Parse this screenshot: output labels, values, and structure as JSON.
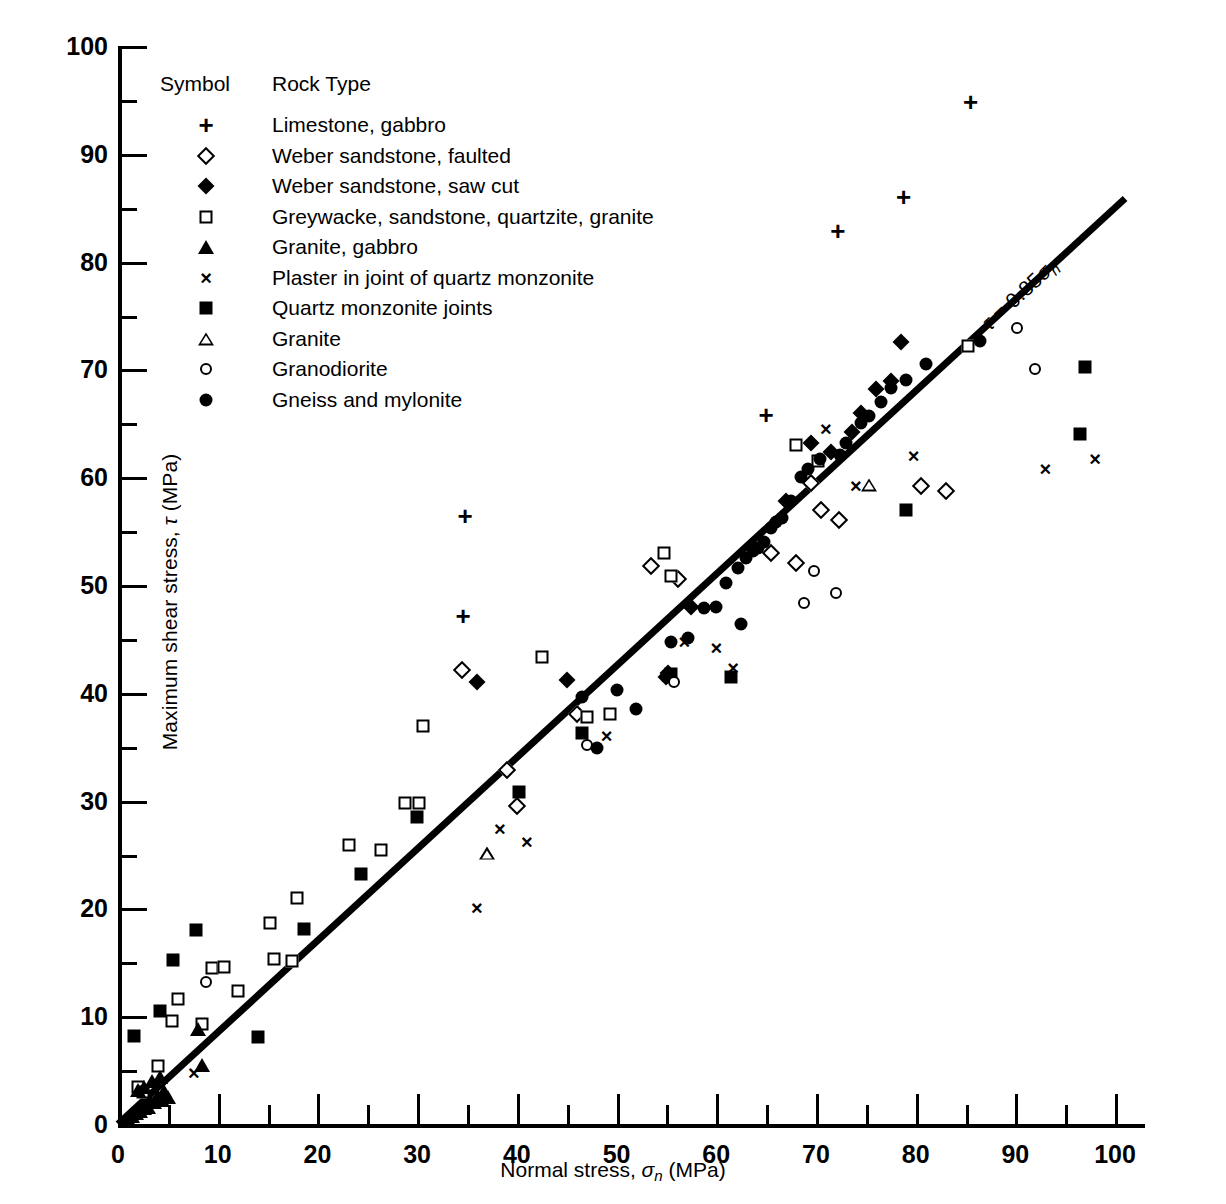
{
  "chart_data": {
    "type": "scatter",
    "title": "",
    "xlabel": "Normal stress, σn (MPa)",
    "ylabel": "Maximum shear stress, τ (MPa)",
    "xlim": [
      0,
      103
    ],
    "ylim": [
      0,
      100
    ],
    "x_major_ticks": [
      0,
      10,
      20,
      30,
      40,
      50,
      60,
      70,
      80,
      90,
      100
    ],
    "x_minor_ticks": [
      5,
      15,
      25,
      35,
      45,
      55,
      65,
      75,
      85,
      95
    ],
    "y_major_ticks": [
      0,
      10,
      20,
      30,
      40,
      50,
      60,
      70,
      80,
      90,
      100
    ],
    "y_minor_ticks": [
      5,
      15,
      25,
      35,
      45,
      55,
      65,
      75,
      85,
      95
    ],
    "grid": false,
    "legend_position": "upper-left-inside",
    "trendline": {
      "label": "τ = 0.85σn",
      "slope": 0.85,
      "intercept": 0,
      "x_start": 0,
      "x_end": 101
    },
    "legend_header": {
      "symbol": "Symbol",
      "rock_type": "Rock Type"
    },
    "series": [
      {
        "name": "Limestone, gabbro",
        "marker": "plus",
        "points": [
          [
            34.8,
            56.4
          ],
          [
            34.6,
            47.1
          ],
          [
            65.0,
            65.8
          ],
          [
            72.2,
            82.8
          ],
          [
            78.8,
            86.0
          ],
          [
            85.5,
            94.8
          ]
        ]
      },
      {
        "name": "Weber sandstone, faulted",
        "marker": "open-diamond",
        "points": [
          [
            34.5,
            42.1
          ],
          [
            40.0,
            29.5
          ],
          [
            39.0,
            32.8
          ],
          [
            46.0,
            38.0
          ],
          [
            53.5,
            51.8
          ],
          [
            56.2,
            50.6
          ],
          [
            68.0,
            52.0
          ],
          [
            69.5,
            59.5
          ],
          [
            70.5,
            57.0
          ],
          [
            80.5,
            59.2
          ],
          [
            83.0,
            58.7
          ],
          [
            72.3,
            56.0
          ],
          [
            65.5,
            53.0
          ]
        ]
      },
      {
        "name": "Weber sandstone, saw cut",
        "marker": "filled-diamond",
        "points": [
          [
            36.0,
            41.0
          ],
          [
            45.0,
            41.2
          ],
          [
            55.0,
            41.5
          ],
          [
            57.5,
            48.0
          ],
          [
            67.0,
            57.8
          ],
          [
            69.5,
            63.2
          ],
          [
            71.5,
            62.3
          ],
          [
            73.6,
            64.2
          ],
          [
            74.5,
            66.0
          ],
          [
            76.0,
            68.2
          ],
          [
            77.5,
            68.9
          ],
          [
            78.5,
            72.5
          ],
          [
            55.2,
            41.8
          ]
        ]
      },
      {
        "name": "Greywacke, sandstone, quartzite, granite",
        "marker": "open-square",
        "points": [
          [
            2.0,
            3.4
          ],
          [
            2.5,
            3.0
          ],
          [
            4.0,
            5.4
          ],
          [
            5.4,
            9.6
          ],
          [
            6.0,
            11.6
          ],
          [
            8.4,
            9.3
          ],
          [
            9.4,
            14.5
          ],
          [
            10.6,
            14.6
          ],
          [
            12.0,
            12.3
          ],
          [
            15.6,
            15.3
          ],
          [
            17.5,
            15.1
          ],
          [
            15.2,
            18.6
          ],
          [
            18.0,
            21.0
          ],
          [
            23.2,
            25.9
          ],
          [
            26.4,
            25.4
          ],
          [
            28.8,
            29.8
          ],
          [
            30.6,
            36.9
          ],
          [
            30.2,
            29.8
          ],
          [
            42.5,
            43.3
          ],
          [
            47.0,
            37.8
          ],
          [
            49.3,
            38.0
          ],
          [
            54.8,
            53.0
          ],
          [
            55.5,
            50.8
          ],
          [
            68.0,
            63.0
          ],
          [
            70.2,
            61.5
          ],
          [
            85.2,
            72.2
          ]
        ]
      },
      {
        "name": "Granite, gabbro",
        "marker": "filled-triangle",
        "points": [
          [
            1.0,
            0.5
          ],
          [
            1.4,
            0.7
          ],
          [
            1.8,
            1.0
          ],
          [
            2.2,
            1.2
          ],
          [
            2.6,
            1.5
          ],
          [
            3.0,
            1.6
          ],
          [
            3.2,
            2.2
          ],
          [
            3.6,
            2.0
          ],
          [
            4.0,
            2.6
          ],
          [
            4.4,
            2.2
          ],
          [
            4.6,
            3.1
          ],
          [
            5.0,
            2.5
          ],
          [
            2.0,
            3.2
          ],
          [
            2.6,
            3.4
          ],
          [
            3.4,
            4.0
          ],
          [
            4.2,
            4.4
          ],
          [
            8.4,
            5.5
          ],
          [
            8.0,
            8.8
          ]
        ]
      },
      {
        "name": "Plaster in joint of quartz monzonite",
        "marker": "cross",
        "points": [
          [
            7.6,
            4.7
          ],
          [
            36.0,
            20.0
          ],
          [
            38.3,
            27.4
          ],
          [
            41.0,
            26.2
          ],
          [
            49.0,
            36.0
          ],
          [
            55.0,
            41.5
          ],
          [
            56.8,
            44.7
          ],
          [
            61.7,
            42.3
          ],
          [
            60.0,
            44.2
          ],
          [
            71.0,
            64.5
          ],
          [
            74.0,
            59.2
          ],
          [
            79.8,
            62.0
          ],
          [
            93.0,
            60.8
          ],
          [
            98.0,
            61.7
          ]
        ]
      },
      {
        "name": "Quartz monzonite joints",
        "marker": "filled-square",
        "points": [
          [
            1.6,
            8.2
          ],
          [
            4.2,
            10.5
          ],
          [
            5.5,
            15.2
          ],
          [
            7.8,
            18.0
          ],
          [
            14.0,
            8.1
          ],
          [
            18.7,
            18.1
          ],
          [
            24.4,
            23.2
          ],
          [
            30.0,
            28.5
          ],
          [
            40.2,
            30.8
          ],
          [
            46.5,
            36.3
          ],
          [
            55.5,
            41.7
          ],
          [
            61.5,
            41.5
          ],
          [
            79.0,
            57.0
          ],
          [
            96.5,
            64.0
          ],
          [
            97.0,
            70.2
          ]
        ]
      },
      {
        "name": "Granite",
        "marker": "open-triangle",
        "points": [
          [
            37.0,
            25.1
          ],
          [
            75.3,
            59.3
          ]
        ]
      },
      {
        "name": "Granodiorite",
        "marker": "open-circle",
        "points": [
          [
            8.8,
            13.2
          ],
          [
            47.0,
            35.2
          ],
          [
            55.8,
            41.0
          ],
          [
            68.8,
            48.3
          ],
          [
            69.8,
            51.3
          ],
          [
            72.0,
            49.3
          ],
          [
            90.2,
            73.8
          ],
          [
            92.0,
            70.0
          ]
        ]
      },
      {
        "name": "Gneiss and mylonite",
        "marker": "filled-circle",
        "points": [
          [
            46.5,
            39.6
          ],
          [
            48.0,
            34.9
          ],
          [
            50.0,
            40.3
          ],
          [
            52.0,
            38.5
          ],
          [
            55.5,
            44.7
          ],
          [
            57.2,
            45.1
          ],
          [
            58.8,
            47.9
          ],
          [
            60.0,
            48.0
          ],
          [
            61.0,
            50.2
          ],
          [
            62.2,
            51.6
          ],
          [
            63.0,
            52.5
          ],
          [
            63.7,
            53.2
          ],
          [
            64.2,
            53.4
          ],
          [
            64.8,
            54.0
          ],
          [
            65.5,
            55.3
          ],
          [
            66.0,
            55.8
          ],
          [
            66.6,
            56.2
          ],
          [
            67.5,
            57.8
          ],
          [
            62.5,
            46.4
          ],
          [
            68.5,
            60.0
          ],
          [
            69.2,
            60.8
          ],
          [
            70.4,
            61.7
          ],
          [
            72.4,
            62.1
          ],
          [
            73.0,
            63.2
          ],
          [
            74.5,
            65.0
          ],
          [
            75.3,
            65.7
          ],
          [
            76.5,
            67.0
          ],
          [
            77.5,
            68.3
          ],
          [
            79.0,
            69.0
          ],
          [
            81.0,
            70.5
          ],
          [
            86.5,
            72.6
          ]
        ]
      }
    ]
  },
  "legend": {
    "header_symbol": "Symbol",
    "header_rock_type": "Rock Type",
    "items": [
      {
        "marker": "plus",
        "label": "Limestone, gabbro"
      },
      {
        "marker": "open-diamond",
        "label": "Weber sandstone, faulted"
      },
      {
        "marker": "filled-diamond",
        "label": "Weber sandstone, saw cut"
      },
      {
        "marker": "open-square",
        "label": "Greywacke, sandstone, quartzite, granite"
      },
      {
        "marker": "filled-triangle",
        "label": "Granite, gabbro"
      },
      {
        "marker": "cross",
        "label": "Plaster in joint of quartz monzonite"
      },
      {
        "marker": "filled-square",
        "label": "Quartz monzonite joints"
      },
      {
        "marker": "open-triangle",
        "label": "Granite"
      },
      {
        "marker": "open-circle",
        "label": "Granodiorite"
      },
      {
        "marker": "filled-circle",
        "label": "Gneiss and mylonite"
      }
    ]
  },
  "axis_titles": {
    "x_prefix": "Normal stress, ",
    "x_sigma": "σ",
    "x_sub": "n",
    "x_units": " (MPa)",
    "y_prefix": "Maximum shear stress, ",
    "y_tau": "τ",
    "y_units": " (MPa)"
  },
  "trendline_label": {
    "tau": "τ",
    "eq": " = 0.85",
    "sigma": "σ",
    "sub": "n"
  },
  "colors": {
    "foreground": "#000000",
    "background": "#ffffff"
  }
}
